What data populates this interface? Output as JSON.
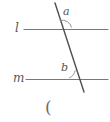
{
  "figure": {
    "type": "geometry-diagram",
    "width": 110,
    "height": 122,
    "background_color": "#ffffff",
    "stroke_color": "#6e6e6e",
    "transversal_color": "#4a4a4a",
    "label_color": "#555555",
    "labels": {
      "line_l": "l",
      "line_m": "m",
      "angle_a": "a",
      "angle_b": "b"
    },
    "caption": "(",
    "lines": [
      {
        "name": "line-l",
        "label": "l",
        "x1": 24,
        "y1": 29,
        "x2": 108,
        "y2": 29
      },
      {
        "name": "line-m",
        "label": "m",
        "x1": 26,
        "y1": 79,
        "x2": 108,
        "y2": 79
      },
      {
        "name": "transversal",
        "label": "",
        "x1": 55,
        "y1": 3,
        "x2": 84,
        "y2": 92
      }
    ],
    "intersections": [
      {
        "name": "upper",
        "x": 63,
        "y": 29
      },
      {
        "name": "lower",
        "x": 79,
        "y": 79
      }
    ],
    "angle_arcs": [
      {
        "name": "angle-a-arc",
        "label": "a",
        "cx": 63,
        "cy": 29,
        "radius": 13
      },
      {
        "name": "angle-b-arc",
        "label": "b",
        "cx": 79,
        "cy": 79,
        "radius": 11
      }
    ]
  }
}
